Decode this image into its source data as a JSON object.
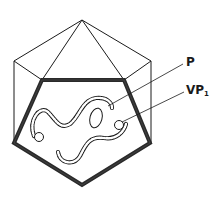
{
  "diagram": {
    "title": "",
    "labels": [
      {
        "id": "P",
        "text": "P",
        "subscript": ""
      },
      {
        "id": "VP1",
        "text": "VP",
        "subscript": "1"
      }
    ],
    "colors": {
      "stroke": "#1a1a1a",
      "capsid_shell": "#2a2a2a",
      "background": "#ffffff"
    }
  }
}
